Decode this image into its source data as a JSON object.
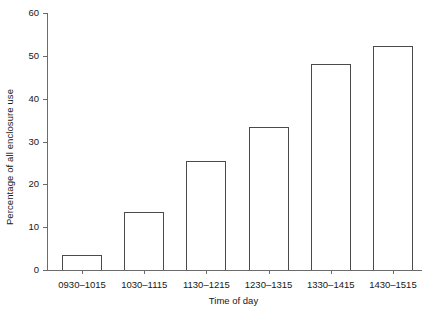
{
  "chart_data": {
    "type": "bar",
    "title": "",
    "subtitle": "",
    "xlabel": "Time of day",
    "ylabel": "Percentage of all enclosure use",
    "categories": [
      "0930–1015",
      "1030–1115",
      "1130–1215",
      "1230–1315",
      "1330–1415",
      "1430–1515"
    ],
    "values": [
      3.5,
      13.5,
      25.5,
      33.5,
      48.0,
      52.3
    ],
    "ylim": [
      0,
      60
    ],
    "yticks": [
      0,
      10,
      20,
      30,
      40,
      50,
      60
    ],
    "ytick_labels": [
      "0",
      "10",
      "20",
      "30",
      "40",
      "50",
      "60"
    ],
    "grid": false,
    "legend": false,
    "legend_position": "none",
    "bar_fill_color": "#ffffff",
    "bar_edge_color": "#4a4a4a",
    "axis_color": "#6b6b6b",
    "text_color": "#171717",
    "background_color": "#ffffff"
  }
}
